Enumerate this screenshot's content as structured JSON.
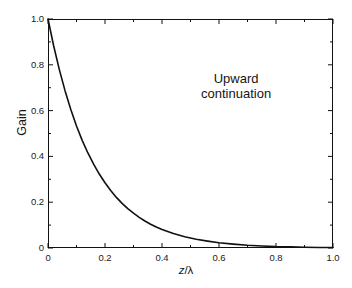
{
  "chart_data": {
    "type": "line",
    "title": "",
    "subtitle": "",
    "xlabel": "z/λ",
    "xlabel_parts": {
      "variable": "z",
      "separator": "/",
      "denominator": "λ"
    },
    "ylabel": "Gain",
    "xlim": [
      0.0,
      1.0
    ],
    "ylim": [
      0.0,
      1.0
    ],
    "grid": false,
    "legend": null,
    "legend_position": "none",
    "x_ticks": [
      "0",
      "0.2",
      "0.4",
      "0.6",
      "0.8",
      "1.0"
    ],
    "x_tick_values": [
      0.0,
      0.2,
      0.4,
      0.6,
      0.8,
      1.0
    ],
    "y_ticks": [
      "0",
      "0.2",
      "0.4",
      "0.6",
      "0.8",
      "1.0"
    ],
    "y_tick_values": [
      0.0,
      0.2,
      0.4,
      0.6,
      0.8,
      1.0
    ],
    "minor_ticks_per_interval": 1,
    "tick_direction": "in",
    "frame": "full-box",
    "line_color": "#111111",
    "line_width": 1.6,
    "background_color": "#ffffff",
    "annotations": [
      {
        "text": "Upward continuation",
        "lines": [
          "Upward",
          "continuation"
        ],
        "x": 0.66,
        "y": 0.74
      }
    ],
    "series": [
      {
        "name": "Upward continuation gain",
        "formula": "exp(-2*pi*z/lambda)",
        "x": [
          0.0,
          0.02,
          0.04,
          0.06,
          0.08,
          0.1,
          0.12,
          0.14,
          0.16,
          0.18,
          0.2,
          0.22,
          0.24,
          0.26,
          0.28,
          0.3,
          0.32,
          0.34,
          0.36,
          0.38,
          0.4,
          0.44,
          0.48,
          0.52,
          0.56,
          0.6,
          0.65,
          0.7,
          0.75,
          0.8,
          0.85,
          0.9,
          0.95,
          1.0
        ],
        "values": [
          1.0,
          0.882,
          0.778,
          0.686,
          0.605,
          0.533,
          0.47,
          0.415,
          0.366,
          0.323,
          0.285,
          0.251,
          0.221,
          0.195,
          0.172,
          0.152,
          0.134,
          0.118,
          0.104,
          0.092,
          0.081,
          0.063,
          0.049,
          0.038,
          0.03,
          0.023,
          0.017,
          0.012,
          0.009,
          0.006,
          0.005,
          0.003,
          0.002,
          0.002
        ]
      }
    ]
  },
  "figure": {
    "background_color": "#ffffff",
    "axis_color": "#111111"
  }
}
